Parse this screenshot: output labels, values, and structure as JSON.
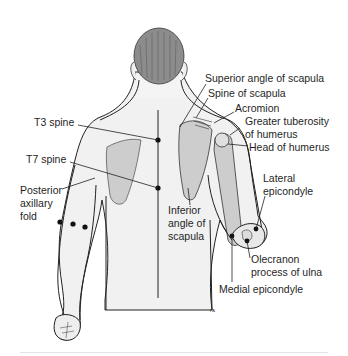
{
  "diagram": {
    "colors": {
      "background": "#ffffff",
      "skin": "#f1f1f1",
      "hair": "#8c8c8c",
      "bone": "#cdcdcd",
      "outline": "#222222",
      "label_text": "#1f1f1f",
      "marker": "#111111"
    },
    "labels": {
      "superior_angle": "Superior angle of scapula",
      "spine_of_scapula": "Spine of scapula",
      "acromion": "Acromion",
      "greater_tuberosity_1": "Greater tuberosity",
      "greater_tuberosity_2": "of humerus",
      "head_of_humerus": "Head of humerus",
      "t3_spine": "T3 spine",
      "t7_spine": "T7 spine",
      "posterior_axillary_1": "Posterior",
      "posterior_axillary_2": "axillary",
      "posterior_axillary_3": "fold",
      "inferior_angle_1": "Inferior",
      "inferior_angle_2": "angle of",
      "inferior_angle_3": "scapula",
      "lateral_epicondyle_1": "Lateral",
      "lateral_epicondyle_2": "epicondyle",
      "olecranon_1": "Olecranon",
      "olecranon_2": "process of ulna",
      "medial_epicondyle": "Medial epicondyle"
    },
    "credit": "PA"
  }
}
